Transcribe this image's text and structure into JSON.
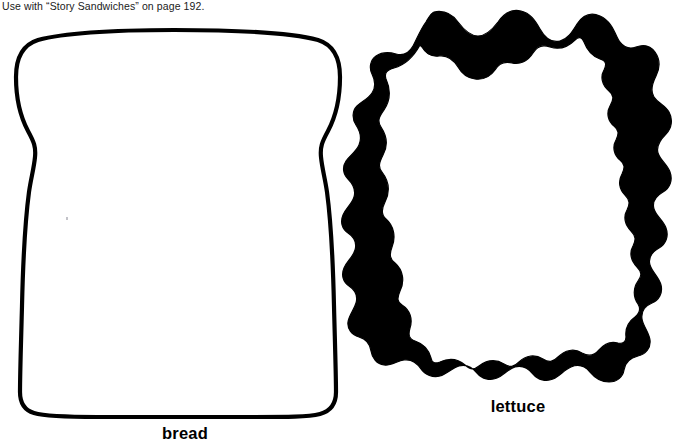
{
  "page": {
    "width": 686,
    "height": 443,
    "background_color": "#ffffff",
    "ink_color": "#000000",
    "title_note": "Use with “Story Sandwiches” on page 192."
  },
  "header": {
    "note": "Use with “Story Sandwiches” on page 192.",
    "reference_activity": "Story Sandwiches",
    "page_reference": "192"
  },
  "templates": [
    {
      "id": "bread",
      "caption": "bread",
      "style": "outline",
      "fill_color": "#ffffff",
      "stroke_color": "#000000",
      "stroke_width": 4,
      "bounds": {
        "x": 8,
        "y": 29,
        "width": 332,
        "height": 388
      },
      "caption_position": {
        "x": 185,
        "y": 438
      }
    },
    {
      "id": "lettuce",
      "caption": "lettuce",
      "style": "solid-band",
      "fill_color": "#000000",
      "stroke_color": "#000000",
      "band_width": 14,
      "bounds": {
        "x": 348,
        "y": 9,
        "width": 328,
        "height": 379
      },
      "caption_position": {
        "x": 517,
        "y": 411
      }
    }
  ],
  "captions": {
    "bread": "bread",
    "lettuce": "lettuce"
  },
  "artifacts": {
    "speck_note": ""
  }
}
